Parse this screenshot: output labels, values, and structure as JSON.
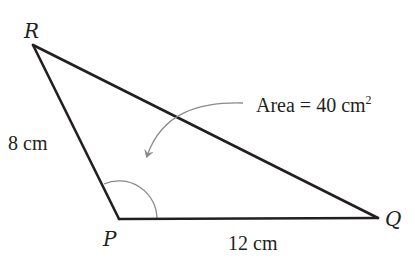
{
  "diagram": {
    "type": "triangle",
    "vertices": {
      "R": "R",
      "P": "P",
      "Q": "Q"
    },
    "sides": {
      "PR": {
        "length": 8,
        "unit": "cm",
        "label": "8 cm"
      },
      "PQ": {
        "length": 12,
        "unit": "cm",
        "label": "12 cm"
      }
    },
    "angle_marked": "P",
    "annotation": {
      "text_prefix": "Area = 40 cm",
      "text_superscript": "2",
      "area_value": 40,
      "unit": "cm²"
    },
    "colors": {
      "edge": "#231f20",
      "arc": "#8a8a8a",
      "arrow": "#8a8a8a",
      "text": "#231f20",
      "background": "#ffffff"
    }
  }
}
